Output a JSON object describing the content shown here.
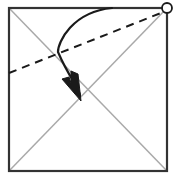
{
  "figure": {
    "description": "Square sheet with both diagonals creased, a dashed valley-fold line running from the left edge to the marked top-right corner, and a curved arrow indicating the corner folding down to the center.",
    "background_color": "#ffffff",
    "canvas": {
      "width": 176,
      "height": 180
    }
  },
  "paper": {
    "name": "square-sheet",
    "shape": "square",
    "stroke_color": "#333333",
    "fill_color": "#ffffff",
    "stroke_width": 2.2,
    "corners": {
      "top_left": [
        9,
        8
      ],
      "top_right": [
        167,
        8
      ],
      "bottom_right": [
        167,
        171
      ],
      "bottom_left": [
        9,
        171
      ]
    }
  },
  "creases": {
    "name": "diagonal-creases",
    "stroke_color": "#a9a9a9",
    "stroke_width": 1.5,
    "lines": [
      {
        "name": "crease-tl-br",
        "from": [
          9,
          8
        ],
        "to": [
          167,
          171
        ]
      },
      {
        "name": "crease-tr-bl",
        "from": [
          167,
          8
        ],
        "to": [
          9,
          171
        ]
      }
    ],
    "intersection": [
      88,
      90
    ]
  },
  "fold_line": {
    "name": "dashed-fold-line",
    "style": "dashed",
    "stroke_color": "#1a1a1a",
    "stroke_width": 2.0,
    "dash_pattern": "8 6",
    "from": [
      9,
      73
    ],
    "to": [
      166,
      11
    ]
  },
  "corner_marker": {
    "name": "top-right-corner-marker",
    "shape": "circle",
    "center": [
      167,
      8
    ],
    "radius": 5.0,
    "stroke_color": "#1a1a1a",
    "fill_color": "#ffffff",
    "stroke_width": 1.8
  },
  "fold_arrow": {
    "name": "fold-motion-arrow",
    "stroke_color": "#1a1a1a",
    "stroke_width": 2.2,
    "start": [
      112,
      8
    ],
    "end": [
      80,
      96
    ],
    "control_points": [
      [
        72,
        12
      ],
      [
        58,
        42
      ],
      [
        70,
        80
      ]
    ],
    "arrowhead": {
      "name": "arrowhead",
      "tip": [
        80,
        100
      ],
      "fill_color": "#1a1a1a",
      "points": "80,100 62,76 68,74 72,82 74,70 80,72"
    }
  },
  "legend": {
    "dashed_line_meaning": "valley fold line",
    "solid_gray_line_meaning": "existing crease",
    "arrow_meaning": "fold direction",
    "circle_meaning": "corner reference point"
  }
}
